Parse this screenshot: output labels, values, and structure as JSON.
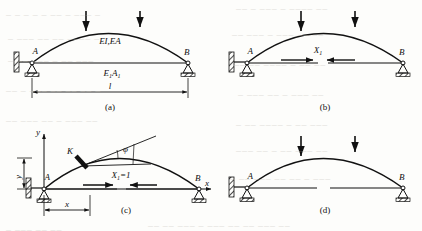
{
  "figure": {
    "type": "structural-mechanics-diagram",
    "stroke_color": "#111111",
    "background_color": "#fdfdfb"
  },
  "panels": [
    {
      "id": "a",
      "caption": "(a)",
      "labels": {
        "support_left": "A",
        "support_right": "B",
        "arch_rib": "EI,EA",
        "tie_rod": "E₁A₁",
        "span": "l"
      },
      "loads": {
        "count": 2,
        "direction": "down"
      },
      "dimension": {
        "name": "span",
        "label": "l"
      }
    },
    {
      "id": "b",
      "caption": "(b)",
      "labels": {
        "support_left": "A",
        "support_right": "B",
        "redundant_force": "X₁"
      },
      "loads": {
        "count": 2,
        "direction": "down"
      },
      "tie_rod_state": "cut, redundant pair applied"
    },
    {
      "id": "c",
      "caption": "(c)",
      "labels": {
        "support_left": "A",
        "support_right": "B",
        "section_point": "K",
        "tangent_angle": "φ",
        "unit_force": "X₁=1",
        "axis_x": "x",
        "axis_y": "y",
        "ordinate": "y",
        "abscissa": "x"
      },
      "loads": {
        "count": 0,
        "direction": "none"
      },
      "tie_rod_state": "cut, unit redundant pair applied"
    },
    {
      "id": "d",
      "caption": "(d)",
      "labels": {
        "support_left": "A",
        "support_right": "B"
      },
      "loads": {
        "count": 2,
        "direction": "down"
      },
      "tie_rod_state": "cut, primary system under load"
    }
  ],
  "ghost_text": [
    {
      "text": "─ ─ ─ ─ ─   ── ─ ─── ─",
      "x": 6,
      "y": 12
    },
    {
      "text": "── ─ ───  ─ ──── ──",
      "x": 236,
      "y": 6
    },
    {
      "text": "─ ─── ──  ── ──── ─",
      "x": 8,
      "y": 36
    },
    {
      "text": "── ─── ─  ─── ── ──",
      "x": 232,
      "y": 32
    },
    {
      "text": "─ ── ─── ─  ── ───",
      "x": 8,
      "y": 58
    },
    {
      "text": "── ── ────  ─ ── ──",
      "x": 234,
      "y": 62
    },
    {
      "text": "── ─ ─── ──  ── ── ─",
      "x": 6,
      "y": 88
    },
    {
      "text": "─ ─── ── ─  ─── ──",
      "x": 238,
      "y": 92
    },
    {
      "text": "── ─── ──  ─ ─── ──",
      "x": 6,
      "y": 118
    },
    {
      "text": "─ ── ──── ─  ── ───",
      "x": 236,
      "y": 122
    },
    {
      "text": "─── ── ─ ──  ─── ──",
      "x": 236,
      "y": 148
    },
    {
      "text": "─ ── ─── ──  ── ─ ───",
      "x": 230,
      "y": 176
    },
    {
      "text": "── ── ─── ─  ─── ── ── ─── ──",
      "x": 148,
      "y": 223
    },
    {
      "text": "─ ─── ── ──",
      "x": 6,
      "y": 227
    }
  ]
}
